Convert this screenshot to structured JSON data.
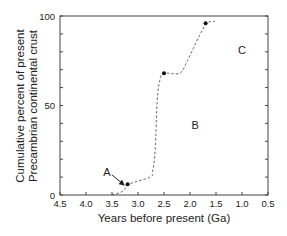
{
  "chart_data": {
    "type": "line",
    "title": "",
    "xlabel": "Years before present (Ga)",
    "ylabel_lines": [
      "Cumulative percent of present",
      "Precambrian continental crust"
    ],
    "xlim": [
      4.5,
      0.5
    ],
    "ylim": [
      0,
      100
    ],
    "x_reversed": true,
    "x_ticks": [
      4.5,
      4.0,
      3.5,
      3.0,
      2.5,
      2.0,
      1.5,
      1.0,
      0.5
    ],
    "x_tick_labels": [
      "4.5",
      "4.0",
      "3.5",
      "3.0",
      "2.5",
      "2.0",
      "1.5",
      "1.0",
      "0.5"
    ],
    "y_ticks": [
      0,
      50,
      100
    ],
    "y_tick_labels": [
      "0",
      "50",
      "100"
    ],
    "y_minor_ticks": [
      10,
      20,
      30,
      40,
      60,
      70,
      80,
      90
    ],
    "grid": false,
    "legend": null,
    "series": [
      {
        "name": "Cumulative crust growth",
        "style": "dashed",
        "x": [
          3.5,
          3.3,
          3.17,
          2.77,
          2.72,
          2.67,
          2.63,
          2.58,
          2.5,
          2.2,
          2.05,
          1.82,
          1.67,
          1.52
        ],
        "y": [
          0,
          2,
          6,
          10,
          13,
          25,
          53,
          64,
          68,
          68,
          75,
          89,
          96,
          97
        ]
      }
    ],
    "markers": [
      {
        "x": 3.2,
        "y": 6
      },
      {
        "x": 2.5,
        "y": 68
      },
      {
        "x": 1.7,
        "y": 96
      }
    ],
    "annotations": [
      {
        "text": "A",
        "x": 3.6,
        "y": 13,
        "arrow_to": {
          "x": 3.25,
          "y": 5
        }
      },
      {
        "text": "B",
        "x": 1.9,
        "y": 39
      },
      {
        "text": "C",
        "x": 1.0,
        "y": 81
      }
    ]
  }
}
